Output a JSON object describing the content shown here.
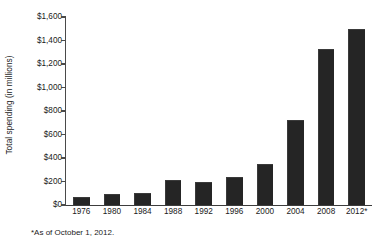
{
  "chart_data": {
    "type": "bar",
    "title": "",
    "subtitle": "",
    "xlabel": "",
    "ylabel": "Total spending (in millions)",
    "categories": [
      "1976",
      "1980",
      "1984",
      "1988",
      "1992",
      "1996",
      "2000",
      "2004",
      "2008",
      "2012*"
    ],
    "values": [
      65,
      90,
      105,
      210,
      195,
      240,
      350,
      725,
      1330,
      1500
    ],
    "ylim": [
      0,
      1600
    ],
    "ytick_values": [
      0,
      200,
      400,
      600,
      800,
      1000,
      1200,
      1400,
      1600
    ],
    "ytick_labels": [
      "$0",
      "$200",
      "$400",
      "$600",
      "$800",
      "$1,000",
      "$1,200",
      "$1,400",
      "$1,600"
    ],
    "grid": false,
    "legend": false,
    "legend_position": "none",
    "bar_color": "#252525",
    "axis_color": "#4a4a4a",
    "text_color": "#1a1a1a",
    "background_color": "#ffffff",
    "annotations": [
      "*As of October 1, 2012."
    ]
  },
  "footnote": {
    "text": "*As of October 1, 2012."
  }
}
